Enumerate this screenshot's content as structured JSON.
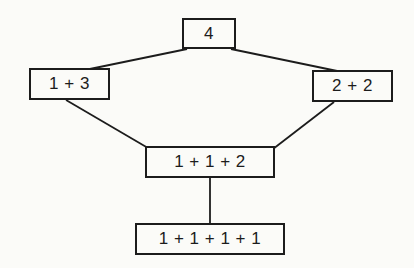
{
  "diagram": {
    "nodes": [
      {
        "id": "4",
        "label": "4"
      },
      {
        "id": "1-3",
        "label": "1 + 3"
      },
      {
        "id": "2-2",
        "label": "2 + 2"
      },
      {
        "id": "1-1-2",
        "label": "1 + 1 + 2"
      },
      {
        "id": "1-1-1-1",
        "label": "1 + 1 + 1 + 1"
      }
    ],
    "edges": [
      {
        "from": "4",
        "to": "1-3"
      },
      {
        "from": "4",
        "to": "2-2"
      },
      {
        "from": "1-3",
        "to": "1-1-2"
      },
      {
        "from": "2-2",
        "to": "1-1-2"
      },
      {
        "from": "1-1-2",
        "to": "1-1-1-1"
      }
    ],
    "colors": {
      "line": "#1c1c1c",
      "background": "#fbfbf8"
    }
  }
}
